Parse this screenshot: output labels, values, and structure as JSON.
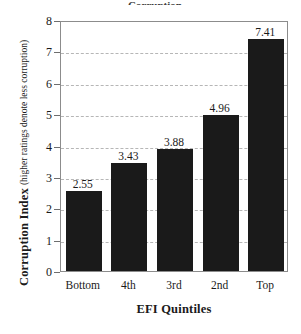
{
  "figure": {
    "title_sliver": "Corruption",
    "background": "#ffffff",
    "bar_color": "#1a1a1a",
    "grid_color": "#b6b6b6",
    "frame_color": "#8c8c8c"
  },
  "axis": {
    "y_title_main": "Corruption Index",
    "y_title_sub": "(higher ratings denote less corruption)",
    "x_title": "EFI Quintiles"
  },
  "chart_data": {
    "type": "bar",
    "title": "",
    "xlabel": "EFI Quintiles",
    "ylabel": "Corruption Index (higher ratings denote less corruption)",
    "categories": [
      "Bottom",
      "4th",
      "3rd",
      "2nd",
      "Top"
    ],
    "values": [
      2.55,
      3.43,
      3.88,
      4.96,
      7.41
    ],
    "data_labels": [
      "2.55",
      "3.43",
      "3.88",
      "4.96",
      "7.41"
    ],
    "ylim": [
      0,
      8
    ],
    "yticks": [
      0,
      1,
      2,
      3,
      4,
      5,
      6,
      7,
      8
    ],
    "ytick_labels": [
      "0",
      "1",
      "2",
      "3",
      "4",
      "5",
      "6",
      "7",
      "8"
    ],
    "grid": true,
    "grid_axis": "y",
    "grid_style": "dashed",
    "legend": false,
    "series": [
      {
        "name": "Corruption Index",
        "color": "#1a1a1a",
        "values": [
          2.55,
          3.43,
          3.88,
          4.96,
          7.41
        ]
      }
    ]
  }
}
